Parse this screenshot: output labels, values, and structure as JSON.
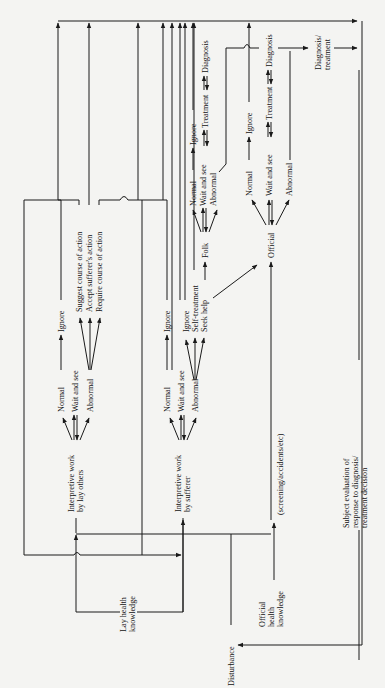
{
  "diagram": {
    "orientation": "rotated-90-ccw",
    "nodes": {
      "lay_knowledge": "Lay health knowledge",
      "lay_knowledge_l1": "Lay health",
      "lay_knowledge_l2": "knowledge",
      "interp_lay_l1": "Interpretive work",
      "interp_lay_l2": "by lay others",
      "interp_suf_l1": "Interpretive work",
      "interp_suf_l2": "by sufferer",
      "official_knowledge_l1": "Official",
      "official_knowledge_l2": "health",
      "official_knowledge_l3": "knowledge",
      "disturbance": "Disturbance",
      "screening": "(screening/accidents/etc)",
      "subject_eval_l1": "Subject evaluation of",
      "subject_eval_l2": "response to diagnosis/",
      "subject_eval_l3": "treatment decision",
      "diag_treat_l1": "Diagnosis/",
      "diag_treat_l2": "treatment"
    },
    "lay_others_branch": {
      "normal": "Normal",
      "wait": "Wait and see",
      "abnormal": "Abnormal",
      "ignore": "Ignore",
      "suggest": "Suggest course of action",
      "accept": "Accept sufferer's action",
      "require": "Require course of action"
    },
    "sufferer_branch": {
      "normal": "Normal",
      "wait": "Wait and see",
      "abnormal": "Abnormal",
      "ignore": "Ignore",
      "ignore2": "Ignore",
      "self_treatment": "Self-treatment",
      "seek_help": "Seek help"
    },
    "folk_branch": {
      "folk": "Folk",
      "normal": "Normal",
      "wait": "Wait and see",
      "abnormal": "Abnormal",
      "ignore": "Ignore",
      "treatment": "Treatment",
      "diagnosis": "Diagnosis"
    },
    "official_branch": {
      "official": "Official",
      "normal": "Normal",
      "wait": "Wait and see",
      "abnormal": "Abnormal",
      "ignore": "Ignore",
      "treatment": "Treatment",
      "diagnosis": "Diagnosis"
    }
  }
}
